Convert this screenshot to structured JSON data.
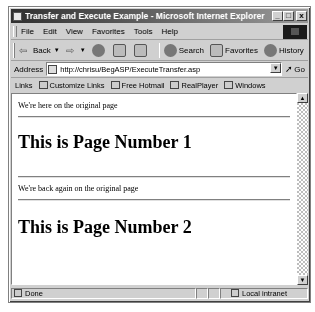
{
  "window": {
    "title": "Transfer and Execute Example - Microsoft Internet Explorer",
    "minimize": "_",
    "maximize": "□",
    "close": "x"
  },
  "menubar": {
    "items": [
      "File",
      "Edit",
      "View",
      "Favorites",
      "Tools",
      "Help"
    ]
  },
  "toolbar": {
    "back_label": "Back",
    "search_label": "Search",
    "favorites_label": "Favorites",
    "history_label": "History",
    "more": "»"
  },
  "addressbar": {
    "label": "Address",
    "url": "http://chrisu/BegASP/ExecuteTransfer.asp",
    "go_label": "Go"
  },
  "linksbar": {
    "label": "Links",
    "items": [
      "Customize Links",
      "Free Hotmail",
      "RealPlayer",
      "Windows"
    ]
  },
  "content": {
    "line1": "We're here on the original page",
    "heading1": "This is Page Number 1",
    "line2": "We're back again on the original page",
    "heading2": "This is Page Number 2"
  },
  "statusbar": {
    "status": "Done",
    "zone": "Local intranet"
  }
}
